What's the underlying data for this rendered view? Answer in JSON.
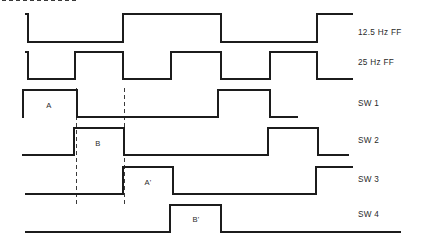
{
  "diagram": {
    "kind": "timing-diagram",
    "width": 422,
    "height": 248,
    "background_color": "#ffffff",
    "stroke_color": "#1c1c1c",
    "marker_color": "#3a3a3a"
  },
  "signals": [
    {
      "id": "ff-12-5",
      "label": "12.5 Hz FF",
      "label_x": 358,
      "label_y": 33,
      "high_y": 14,
      "low_y": 42,
      "start_x": 26,
      "end_x": 352,
      "initial_level": "high",
      "edges": [
        28,
        123,
        221,
        317
      ],
      "path": "M 26 14 L 28 14 L 28 42 L 123 42 L 123 14 L 221 14 L 221 42 L 317 42 L 317 14 L 352 14"
    },
    {
      "id": "ff-25",
      "label": "25 Hz FF",
      "label_x": 358,
      "label_y": 63,
      "high_y": 52,
      "low_y": 79,
      "start_x": 26,
      "end_x": 352,
      "initial_level": "high",
      "edges": [
        28,
        75,
        123,
        171,
        221,
        270,
        317
      ],
      "path": "M 26 52 L 28 52 L 28 79 L 75 79 L 75 52 L 123 52 L 123 79 L 171 79 L 171 52 L 221 52 L 221 79 L 270 79 L 270 52 L 317 52 L 317 79 L 352 79"
    },
    {
      "id": "sw-1",
      "label": "SW 1",
      "label_x": 358,
      "label_y": 104,
      "high_y": 90,
      "low_y": 117,
      "start_x": 23,
      "end_x": 297,
      "initial_level": "high",
      "edges": [
        77,
        218,
        270
      ],
      "path": "M 23 117 L 23 90 L 77 90 L 77 117 L 218 117 L 218 90 L 270 90 L 270 117 L 297 117"
    },
    {
      "id": "sw-2",
      "label": "SW 2",
      "label_x": 358,
      "label_y": 141,
      "high_y": 128,
      "low_y": 155,
      "start_x": 23,
      "end_x": 348,
      "initial_level": "low",
      "edges": [
        74,
        124,
        268,
        318
      ],
      "path": "M 23 155 L 74 155 L 74 128 L 124 128 L 124 155 L 268 155 L 268 128 L 318 128 L 318 155 L 348 155"
    },
    {
      "id": "sw-3",
      "label": "SW 3",
      "label_x": 358,
      "label_y": 180,
      "high_y": 167,
      "low_y": 194,
      "start_x": 26,
      "end_x": 352,
      "initial_level": "low",
      "edges": [
        123,
        173,
        316
      ],
      "path": "M 26 194 L 123 194 L 123 167 L 173 167 L 173 194 L 316 194 L 316 167 L 352 167"
    },
    {
      "id": "sw-4",
      "label": "SW 4",
      "label_x": 358,
      "label_y": 215,
      "high_y": 205,
      "low_y": 232,
      "start_x": 26,
      "end_x": 400,
      "initial_level": "low",
      "edges": [
        170,
        221
      ],
      "path": "M 26 232 L 170 232 L 170 205 L 221 205 L 221 232 L 400 232"
    }
  ],
  "annotations": [
    {
      "id": "annot-a",
      "text": "A",
      "x": 49,
      "y": 106
    },
    {
      "id": "annot-b",
      "text": "B",
      "x": 98,
      "y": 144
    },
    {
      "id": "annot-a-prime",
      "text": "A'",
      "x": 148,
      "y": 183
    },
    {
      "id": "annot-b-prime",
      "text": "B'",
      "x": 196,
      "y": 220
    }
  ],
  "markers": [
    {
      "id": "marker-left",
      "x": 76,
      "y1": 88,
      "y2": 207
    },
    {
      "id": "marker-right",
      "x": 124,
      "y1": 88,
      "y2": 207
    }
  ]
}
